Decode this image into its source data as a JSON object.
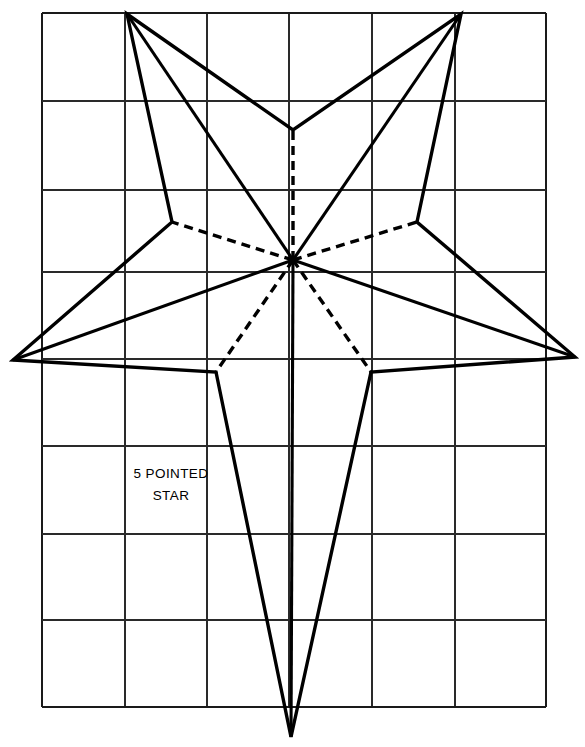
{
  "figure": {
    "title": "5 Pointed Star",
    "caption_line_1": "5 POINTED",
    "caption_line_2": "STAR",
    "caption_anchor_x": 171,
    "caption_line_1_y": 478,
    "caption_line_2_y": 500,
    "ink_color": "#000000",
    "grid_line_color": "#2a2a2a",
    "background_color": "#ffffff",
    "canvas": {
      "width": 585,
      "height": 747
    }
  },
  "grid": {
    "description": "Construction grid of squares behind the star drawing",
    "left": 42,
    "right": 546,
    "top": 13,
    "bottom": 707,
    "columns": 6,
    "rows": 8,
    "vertical_line_x": [
      42,
      125,
      207,
      289,
      372,
      455,
      546
    ],
    "horizontal_line_y": [
      13,
      101,
      190,
      272,
      359,
      446,
      534,
      620,
      707
    ]
  },
  "star": {
    "center": {
      "x": 293,
      "y": 260
    },
    "point_count": 5,
    "outer_points": [
      {
        "name": "top-left-point",
        "x": 127,
        "y": 14
      },
      {
        "name": "top-right-point",
        "x": 461,
        "y": 14
      },
      {
        "name": "right-point",
        "x": 575,
        "y": 357
      },
      {
        "name": "bottom-point",
        "x": 291,
        "y": 737
      },
      {
        "name": "left-point",
        "x": 13,
        "y": 360
      }
    ],
    "inner_vertices": [
      {
        "name": "top-center-notch",
        "x": 293,
        "y": 130
      },
      {
        "name": "right-upper-notch",
        "x": 417,
        "y": 222
      },
      {
        "name": "right-lower-notch",
        "x": 371,
        "y": 372
      },
      {
        "name": "left-lower-notch",
        "x": 216,
        "y": 372
      },
      {
        "name": "left-upper-notch",
        "x": 172,
        "y": 222
      }
    ],
    "outline_path": "M 127 14 L 293 130 L 461 14 L 417 222 L 575 357 L 371 372 L 291 737 L 216 372 L 13 360 L 172 222 Z",
    "solid_fold_lines": [
      {
        "name": "fold-center-to-top-left-point",
        "x1": 293,
        "y1": 260,
        "x2": 127,
        "y2": 14
      },
      {
        "name": "fold-center-to-top-right-point",
        "x1": 293,
        "y1": 260,
        "x2": 461,
        "y2": 14
      },
      {
        "name": "fold-center-to-right-point",
        "x1": 293,
        "y1": 260,
        "x2": 575,
        "y2": 357
      },
      {
        "name": "fold-center-to-bottom-point",
        "x1": 293,
        "y1": 260,
        "x2": 291,
        "y2": 737
      },
      {
        "name": "fold-center-to-left-point",
        "x1": 293,
        "y1": 260,
        "x2": 13,
        "y2": 360
      }
    ],
    "dashed_fold_lines": [
      {
        "name": "dashed-center-to-top-notch",
        "x1": 293,
        "y1": 260,
        "x2": 293,
        "y2": 130
      },
      {
        "name": "dashed-center-to-right-upper-notch",
        "x1": 293,
        "y1": 260,
        "x2": 417,
        "y2": 222
      },
      {
        "name": "dashed-center-to-right-lower-notch",
        "x1": 293,
        "y1": 260,
        "x2": 371,
        "y2": 372
      },
      {
        "name": "dashed-center-to-left-lower-notch",
        "x1": 293,
        "y1": 260,
        "x2": 216,
        "y2": 372
      },
      {
        "name": "dashed-center-to-left-upper-notch",
        "x1": 293,
        "y1": 260,
        "x2": 172,
        "y2": 222
      }
    ]
  }
}
